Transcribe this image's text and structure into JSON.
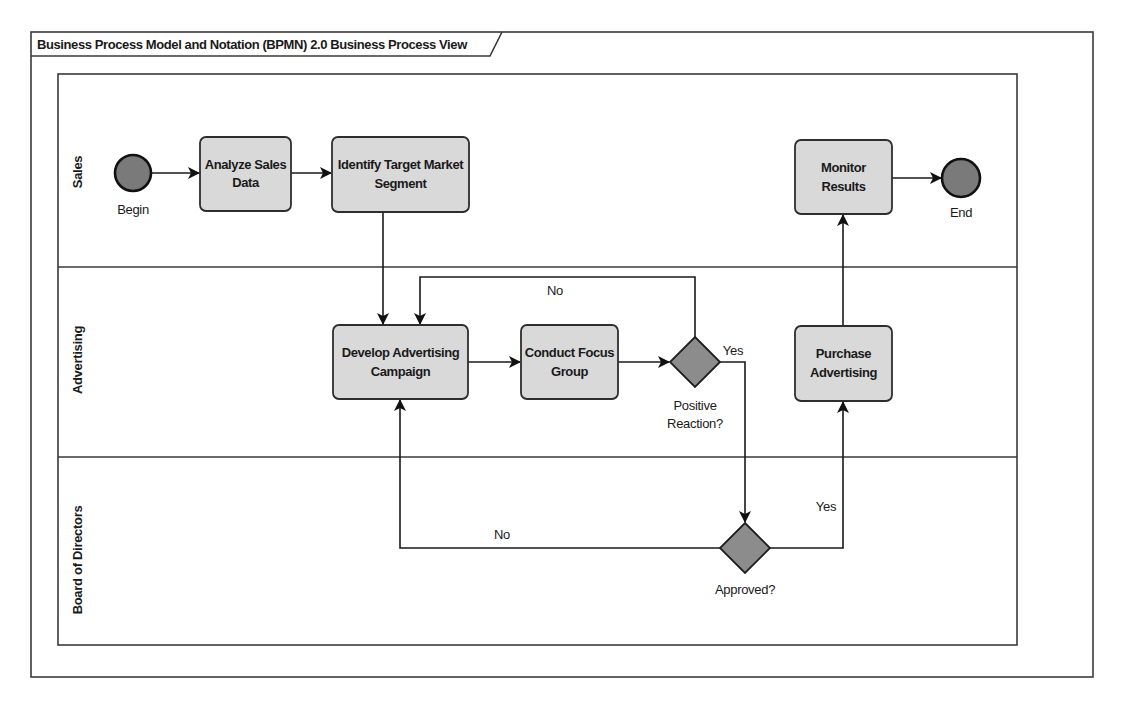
{
  "frame": {
    "title": "Business Process Model and Notation (BPMN) 2.0 Business Process View"
  },
  "lanes": [
    {
      "id": "sales",
      "label": "Sales"
    },
    {
      "id": "advertising",
      "label": "Advertising"
    },
    {
      "id": "board",
      "label": "Board of Directors"
    }
  ],
  "events": {
    "start": {
      "label": "Begin",
      "lane": "sales"
    },
    "end": {
      "label": "End",
      "lane": "sales"
    }
  },
  "tasks": {
    "analyze": {
      "line1": "Analyze Sales",
      "line2": "Data",
      "lane": "sales"
    },
    "identify": {
      "line1": "Identify Target Market",
      "line2": "Segment",
      "lane": "sales"
    },
    "monitor": {
      "line1": "Monitor",
      "line2": "Results",
      "lane": "sales"
    },
    "develop": {
      "line1": "Develop Advertising",
      "line2": "Campaign",
      "lane": "advertising"
    },
    "focus": {
      "line1": "Conduct Focus",
      "line2": "Group",
      "lane": "advertising"
    },
    "purchase": {
      "line1": "Purchase",
      "line2": "Advertising",
      "lane": "advertising"
    }
  },
  "gateways": {
    "positive": {
      "line1": "Positive",
      "line2": "Reaction?",
      "lane": "advertising"
    },
    "approved": {
      "label": "Approved?",
      "lane": "board"
    }
  },
  "flows": [
    {
      "from": "start",
      "to": "analyze",
      "label": ""
    },
    {
      "from": "analyze",
      "to": "identify",
      "label": ""
    },
    {
      "from": "identify",
      "to": "develop",
      "label": ""
    },
    {
      "from": "develop",
      "to": "focus",
      "label": ""
    },
    {
      "from": "focus",
      "to": "positive",
      "label": ""
    },
    {
      "from": "positive",
      "to": "develop",
      "label": "No"
    },
    {
      "from": "positive",
      "to": "approved",
      "label": "Yes"
    },
    {
      "from": "approved",
      "to": "develop",
      "label": "No"
    },
    {
      "from": "approved",
      "to": "purchase",
      "label": "Yes"
    },
    {
      "from": "purchase",
      "to": "monitor",
      "label": ""
    },
    {
      "from": "monitor",
      "to": "end",
      "label": ""
    }
  ],
  "flow_labels": {
    "positive_no": "No",
    "positive_yes": "Yes",
    "approved_no": "No",
    "approved_yes": "Yes"
  },
  "colors": {
    "task_fill": "#d9d9d9",
    "event_fill": "#7a7a7a",
    "gateway_fill": "#8c8c8c",
    "line": "#1a1a1a"
  }
}
